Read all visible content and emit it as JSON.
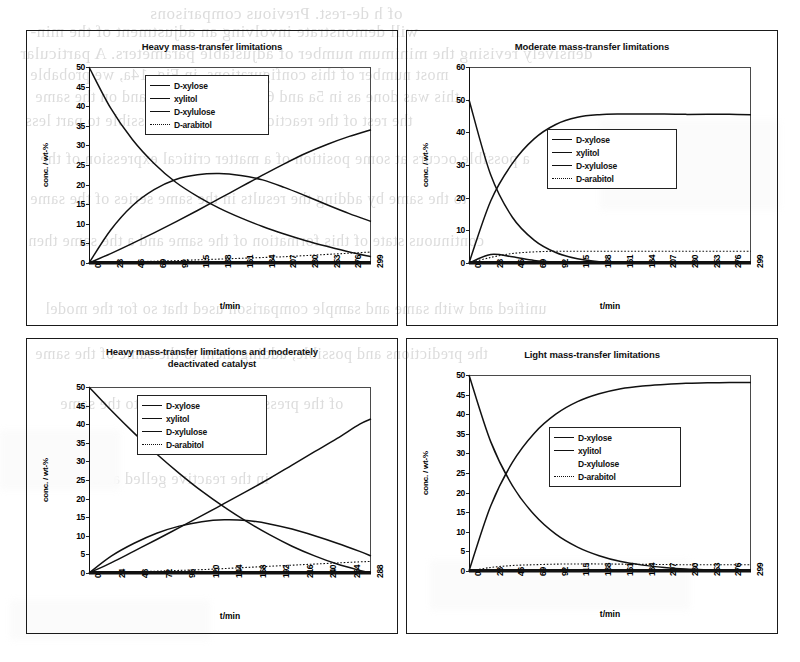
{
  "document": {
    "kind": "scanned-journal-page-figure",
    "ghost_text": [
      "of h de-rest. Previous comparisons",
      "will demonstrate involving an adjustment of the min-",
      "densively revising the minimum number of adjustable parameters. A particular",
      "most number of this configurations, in Fig. 14a, we probable",
      "this was done as in 5a and 6a and 7a and 14a and on the same",
      "the rest of the reaction must now be possible to part less",
      "a possible occurs at some position of a matter critical expression of the",
      "to the same by adding the results in the same series of the same",
      "continuous state of this formation of the same and a the same then",
      "unified and with same and sample comparison used that so for the model",
      "the predictions and possible, adding them to the same of the same",
      "of the pressure are a possible to the same",
      "in the reactive gelled as the"
    ]
  },
  "figure": {
    "panels": [
      {
        "name": "heavy-mass-transfer-limitations",
        "title": "Heavy mass-transfer limitations",
        "chart_data": {
          "type": "line",
          "title": "Heavy mass-transfer limitations",
          "xlabel": "t/min",
          "ylabel": "conc. / wt-%",
          "xlim": [
            0,
            299
          ],
          "ylim": [
            0,
            50
          ],
          "yticks": [
            0,
            5,
            10,
            15,
            20,
            25,
            30,
            35,
            40,
            45,
            50
          ],
          "xticklabels": [
            "0",
            "23",
            "46",
            "69",
            "92",
            "115",
            "138",
            "161",
            "184",
            "207",
            "230",
            "253",
            "276",
            "299"
          ],
          "grid": false,
          "legend_position": "upper-center",
          "x": [
            0,
            23,
            46,
            69,
            92,
            115,
            138,
            161,
            184,
            207,
            230,
            253,
            276,
            299
          ],
          "series": [
            {
              "name": "D-xylose",
              "style": "solid",
              "values": [
                50.0,
                39.5,
                31.5,
                25.4,
                20.6,
                17.0,
                14.0,
                11.5,
                9.3,
                7.4,
                5.7,
                4.2,
                2.8,
                1.6
              ]
            },
            {
              "name": "xylitol",
              "style": "solid",
              "values": [
                0.0,
                2.4,
                5.0,
                7.7,
                10.5,
                13.4,
                16.4,
                19.4,
                22.4,
                25.3,
                28.0,
                30.3,
                32.3,
                34.0
              ]
            },
            {
              "name": "D-xylulose",
              "style": "solid",
              "values": [
                0.0,
                8.4,
                14.6,
                18.7,
                21.3,
                22.5,
                22.8,
                22.3,
                21.2,
                19.3,
                17.1,
                14.8,
                12.6,
                10.6
              ]
            },
            {
              "name": "D-arabitol",
              "style": "dotted",
              "values": [
                0.0,
                0.15,
                0.3,
                0.45,
                0.6,
                0.8,
                1.0,
                1.2,
                1.4,
                1.6,
                1.9,
                2.2,
                2.5,
                2.8
              ]
            }
          ]
        }
      },
      {
        "name": "moderate-mass-transfer-limitations",
        "title": "Moderate mass-transfer limitations",
        "chart_data": {
          "type": "line",
          "title": "Moderate mass-transfer limitations",
          "xlabel": "t/min",
          "ylabel": "conc. / wt-%",
          "xlim": [
            0,
            299
          ],
          "ylim": [
            0,
            60
          ],
          "yticks": [
            0,
            10,
            20,
            30,
            40,
            50,
            60
          ],
          "xticklabels": [
            "0",
            "23",
            "46",
            "69",
            "92",
            "115",
            "138",
            "161",
            "184",
            "207",
            "230",
            "253",
            "276",
            "299"
          ],
          "grid": false,
          "legend_position": "center-right",
          "x": [
            0,
            23,
            46,
            69,
            92,
            115,
            138,
            161,
            184,
            207,
            230,
            253,
            276,
            299
          ],
          "series": [
            {
              "name": "D-xylose",
              "style": "solid",
              "values": [
                50.0,
                27.0,
                14.0,
                7.0,
                3.2,
                1.3,
                0.4,
                0.1,
                0.0,
                0.0,
                0.0,
                0.0,
                0.0,
                0.0
              ]
            },
            {
              "name": "xylitol",
              "style": "solid",
              "values": [
                0.0,
                19.0,
                30.5,
                38.0,
                42.4,
                44.6,
                45.4,
                45.6,
                45.6,
                45.6,
                45.5,
                45.5,
                45.5,
                45.4
              ]
            },
            {
              "name": "D-xylulose",
              "style": "solid",
              "values": [
                0.0,
                2.6,
                1.9,
                0.8,
                0.3,
                0.1,
                0.0,
                0.0,
                0.0,
                0.0,
                0.0,
                0.0,
                0.0,
                0.0
              ]
            },
            {
              "name": "D-arabitol",
              "style": "dotted",
              "values": [
                0.0,
                1.7,
                2.9,
                3.4,
                3.6,
                3.6,
                3.6,
                3.6,
                3.6,
                3.6,
                3.6,
                3.6,
                3.6,
                3.6
              ]
            }
          ]
        }
      },
      {
        "name": "heavy-mass-transfer-deactivated-catalyst",
        "title": "Heavy mass-transfer limitations and moderately deactivated catalyst",
        "title_line1": "Heavy mass-transfer limitations and moderately",
        "title_line2": "deactivated catalyst",
        "chart_data": {
          "type": "line",
          "title": "Heavy mass-transfer limitations and moderately deactivated catalyst",
          "xlabel": "t/min",
          "ylabel": "conc. / wt-%",
          "xlim": [
            0,
            300
          ],
          "ylim": [
            0,
            50
          ],
          "yticks": [
            0,
            5,
            10,
            15,
            20,
            25,
            30,
            35,
            40,
            45,
            50
          ],
          "xticklabels": [
            "0",
            "24",
            "48",
            "72",
            "96",
            "120",
            "144",
            "168",
            "192",
            "216",
            "240",
            "264",
            "288"
          ],
          "grid": false,
          "legend_position": "upper-center",
          "x": [
            0,
            24,
            48,
            72,
            96,
            120,
            144,
            168,
            192,
            216,
            240,
            264,
            288,
            300
          ],
          "series": [
            {
              "name": "D-xylose",
              "style": "solid",
              "values": [
                50.0,
                43.6,
                37.6,
                32.0,
                26.8,
                22.0,
                17.7,
                13.8,
                10.3,
                7.2,
                4.6,
                2.4,
                0.7,
                0.0
              ]
            },
            {
              "name": "xylitol",
              "style": "solid",
              "values": [
                0.0,
                2.8,
                5.9,
                9.0,
                12.2,
                15.4,
                18.7,
                22.0,
                25.4,
                29.0,
                32.6,
                36.2,
                40.0,
                41.4
              ]
            },
            {
              "name": "D-xylulose",
              "style": "solid",
              "values": [
                0.0,
                4.6,
                8.0,
                10.7,
                12.6,
                13.8,
                14.3,
                14.1,
                13.2,
                11.8,
                10.0,
                8.0,
                5.8,
                4.6
              ]
            },
            {
              "name": "D-arabitol",
              "style": "dotted",
              "values": [
                0.0,
                0.15,
                0.3,
                0.5,
                0.7,
                0.9,
                1.2,
                1.5,
                1.8,
                2.1,
                2.4,
                2.7,
                3.0,
                3.1
              ]
            }
          ]
        }
      },
      {
        "name": "light-mass-transfer-limitations",
        "title": "Light mass-transfer limitations",
        "chart_data": {
          "type": "line",
          "title": "Light mass-transfer limitations",
          "xlabel": "t/min",
          "ylabel": "conc. / wt-%",
          "xlim": [
            0,
            299
          ],
          "ylim": [
            0,
            50
          ],
          "yticks": [
            0,
            5,
            10,
            15,
            20,
            25,
            30,
            35,
            40,
            45,
            50
          ],
          "xticklabels": [
            "0",
            "23",
            "46",
            "69",
            "92",
            "115",
            "138",
            "161",
            "184",
            "207",
            "230",
            "253",
            "276",
            "299"
          ],
          "grid": false,
          "legend_position": "center-right",
          "x": [
            0,
            23,
            46,
            69,
            92,
            115,
            138,
            161,
            184,
            207,
            230,
            253,
            276,
            299
          ],
          "series": [
            {
              "name": "D-xylose",
              "style": "solid",
              "values": [
                50.0,
                33.0,
                21.8,
                14.4,
                9.4,
                6.1,
                3.9,
                2.4,
                1.5,
                0.9,
                0.5,
                0.3,
                0.15,
                0.05
              ]
            },
            {
              "name": "xylitol",
              "style": "solid",
              "values": [
                0.0,
                16.6,
                27.7,
                35.1,
                40.0,
                43.2,
                45.2,
                46.5,
                47.2,
                47.6,
                47.9,
                48.0,
                48.1,
                48.1
              ]
            },
            {
              "name": "D-xylulose",
              "style": "blank",
              "values": [
                0.0,
                0.0,
                0.0,
                0.0,
                0.0,
                0.0,
                0.0,
                0.0,
                0.0,
                0.0,
                0.0,
                0.0,
                0.0,
                0.0
              ]
            },
            {
              "name": "D-arabitol",
              "style": "dotted",
              "values": [
                0.0,
                0.9,
                1.4,
                1.6,
                1.75,
                1.8,
                1.8,
                1.75,
                1.7,
                1.65,
                1.6,
                1.6,
                1.6,
                1.6
              ]
            }
          ]
        }
      }
    ],
    "legend_labels": [
      "D-xylose",
      "xylitol",
      "D-xylulose",
      "D-arabitol"
    ],
    "colors": {
      "ink": "#111111",
      "axis": "#222222",
      "frame": "#4a4a4a",
      "ghost": "#8d8d8d",
      "background": "#ffffff"
    }
  }
}
